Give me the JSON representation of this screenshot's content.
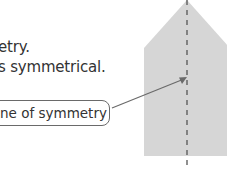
{
  "text_lines": [
    "etry.",
    "s symmetrical."
  ],
  "callout": {
    "label": "ne of symmetry"
  },
  "figure": {
    "shape": "house-shaped pentagon",
    "fill_color": "#d6d6d6",
    "line_color": "#555555",
    "line_style": "dashed",
    "arrow_color": "#666666"
  }
}
